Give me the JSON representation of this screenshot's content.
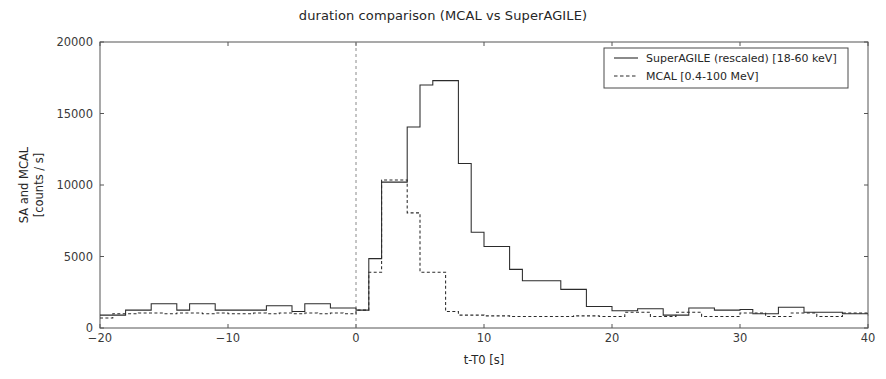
{
  "chart_data": {
    "type": "line",
    "title": "duration comparison (MCAL vs SuperAGILE)",
    "xlabel": "t-T0 [s]",
    "ylabel": "SA and MCAL\n[counts / s]",
    "ylabel_line1": "SA and MCAL",
    "ylabel_line2": "[counts / s]",
    "xlim": [
      -20,
      40
    ],
    "ylim": [
      0,
      20000
    ],
    "xticks": [
      -20,
      -10,
      0,
      10,
      20,
      30,
      40
    ],
    "xtick_labels": [
      "−20",
      "−10",
      "0",
      "10",
      "20",
      "30",
      "40"
    ],
    "yticks": [
      0,
      5000,
      10000,
      15000,
      20000
    ],
    "ytick_labels": [
      "0",
      "5000",
      "10000",
      "15000",
      "20000"
    ],
    "grid": false,
    "drawstyle": "steps-post",
    "bin_width": 1.0,
    "legend_position": "upper right",
    "annotations": [
      {
        "name": "trigger-time",
        "type": "vline",
        "x": 0,
        "style": "dashed",
        "color": "#8a8a8a"
      }
    ],
    "series": [
      {
        "name": "SuperAGILE (rescaled) [18-60 keV]",
        "style": "solid",
        "color": "#2b2b2b",
        "x": [
          -20,
          -19,
          -18,
          -17,
          -16,
          -15,
          -14,
          -13,
          -12,
          -11,
          -10,
          -9,
          -8,
          -7,
          -6,
          -5,
          -4,
          -3,
          -2,
          -1,
          0,
          1,
          2,
          3,
          4,
          5,
          6,
          7,
          8,
          9,
          10,
          11,
          12,
          13,
          14,
          15,
          16,
          17,
          18,
          19,
          20,
          21,
          22,
          23,
          24,
          25,
          26,
          27,
          28,
          29,
          30,
          31,
          32,
          33,
          34,
          35,
          36,
          37,
          38,
          39,
          40
        ],
        "values": [
          900,
          900,
          1250,
          1250,
          1700,
          1700,
          1250,
          1700,
          1700,
          1250,
          1250,
          1250,
          1250,
          1550,
          1550,
          1150,
          1700,
          1700,
          1400,
          1400,
          1250,
          4850,
          10200,
          10200,
          14050,
          17000,
          17300,
          17300,
          11500,
          6700,
          5700,
          5700,
          4100,
          3300,
          3300,
          3300,
          2700,
          2700,
          1500,
          1500,
          1200,
          1200,
          1350,
          1350,
          900,
          900,
          1400,
          1400,
          1250,
          1250,
          1300,
          1000,
          1000,
          1450,
          1450,
          1100,
          1100,
          1100,
          1000,
          1000,
          1000
        ]
      },
      {
        "name": "MCAL [0.4-100 MeV]",
        "style": "dashed",
        "color": "#2b2b2b",
        "x": [
          -20,
          -19,
          -18,
          -17,
          -16,
          -15,
          -14,
          -13,
          -12,
          -11,
          -10,
          -9,
          -8,
          -7,
          -6,
          -5,
          -4,
          -3,
          -2,
          -1,
          0,
          1,
          2,
          3,
          4,
          5,
          6,
          7,
          8,
          9,
          10,
          11,
          12,
          13,
          14,
          15,
          16,
          17,
          18,
          19,
          20,
          21,
          22,
          23,
          24,
          25,
          26,
          27,
          28,
          29,
          30,
          31,
          32,
          33,
          34,
          35,
          36,
          37,
          38,
          39,
          40
        ],
        "values": [
          700,
          1000,
          1000,
          1050,
          1050,
          1000,
          1050,
          1050,
          1000,
          1050,
          1000,
          1000,
          1050,
          1000,
          1050,
          1000,
          1050,
          1000,
          1050,
          1000,
          1250,
          3900,
          10350,
          10350,
          8050,
          3900,
          3900,
          1150,
          900,
          900,
          850,
          850,
          800,
          800,
          800,
          800,
          800,
          850,
          850,
          800,
          800,
          1100,
          1100,
          800,
          800,
          1100,
          1100,
          800,
          800,
          800,
          1050,
          1050,
          800,
          800,
          1050,
          1050,
          800,
          800,
          1050,
          1050,
          900
        ]
      }
    ]
  },
  "legend": {
    "entries": [
      {
        "label": "SuperAGILE (rescaled) [18-60 keV]",
        "style": "solid"
      },
      {
        "label": "MCAL [0.4-100 MeV]",
        "style": "dashed"
      }
    ]
  }
}
